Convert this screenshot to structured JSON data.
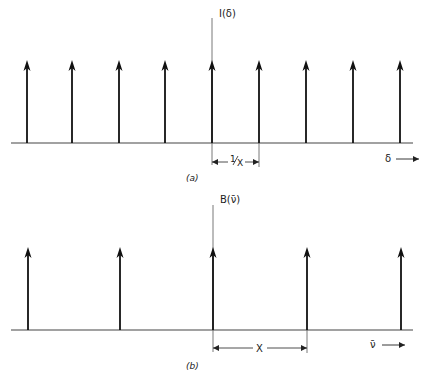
{
  "panel_a": {
    "caption": "(a)",
    "y_label": "I(δ)",
    "x_label": "δ",
    "spacing_label": "1/X",
    "spacing_num": "1",
    "spacing_den": "X",
    "arrow_x": [
      27,
      72,
      119,
      165,
      212,
      259,
      306,
      353,
      400
    ],
    "axis_x": 212,
    "baseline_y": 143,
    "arrow_top_y": 60
  },
  "panel_b": {
    "caption": "(b)",
    "y_label": "B(ν̄)",
    "x_label": "ν̄",
    "spacing_label": "X",
    "arrow_x": [
      28,
      120,
      213,
      307,
      401
    ],
    "axis_x": 213,
    "baseline_y": 330,
    "arrow_top_y": 247
  },
  "colors": {
    "line": "#333333",
    "arrow": "#111111"
  }
}
